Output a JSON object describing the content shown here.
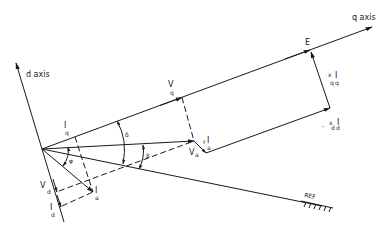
{
  "diagram": {
    "type": "phasor-diagram",
    "axes": {
      "d_axis_label": "d axis",
      "q_axis_label": "q axis",
      "reference_label": "REF"
    },
    "phasors": {
      "E": {
        "label": "E"
      },
      "Vq": {
        "main": "V",
        "sub": "q"
      },
      "Va": {
        "main": "V",
        "sub": "a"
      },
      "Vd": {
        "main": "V",
        "sub": "d"
      },
      "Ia": {
        "main": "I",
        "sub": "a"
      },
      "Iq": {
        "main": "I",
        "sub": "q"
      },
      "Id": {
        "main": "I",
        "sub": "d"
      },
      "rIa": {
        "prefix": "r",
        "main": "I",
        "sub": "a"
      },
      "xqIq": {
        "prefix": "x",
        "prefix_sub": "q",
        "main": "I",
        "sub": "q"
      },
      "xdId": {
        "sign": "-",
        "prefix": "x",
        "prefix_sub": "d",
        "main": "I",
        "sub": "d"
      }
    },
    "angles": {
      "delta": "δ",
      "phi": "φ",
      "beta": "β"
    }
  }
}
